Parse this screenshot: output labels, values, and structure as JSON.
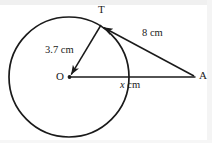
{
  "figure": {
    "kind": "circle-tangent-geometry-diagram",
    "background_color": "#ffffff",
    "stroke_color": "#1a1a1a",
    "labels": {
      "tangent_point": "T",
      "center": "O",
      "external_point": "A",
      "radius_measure": "3.7 cm",
      "tangent_measure": "8 cm",
      "unknown_var": "x",
      "unknown_unit": "cm"
    },
    "geometry": {
      "circle": {
        "cx": 69,
        "cy": 77,
        "r": 60
      },
      "points": {
        "O": {
          "x": 69,
          "y": 77
        },
        "T": {
          "x": 101,
          "y": 25
        },
        "A": {
          "x": 196,
          "y": 77
        }
      },
      "segments": [
        {
          "name": "radius-OT",
          "from": "O",
          "to": "T",
          "label": "3.7 cm"
        },
        {
          "name": "tangent-TA",
          "from": "T",
          "to": "A",
          "label": "8 cm"
        },
        {
          "name": "hypotenuse-OA",
          "from": "O",
          "to": "A",
          "label": "x cm"
        }
      ]
    }
  }
}
